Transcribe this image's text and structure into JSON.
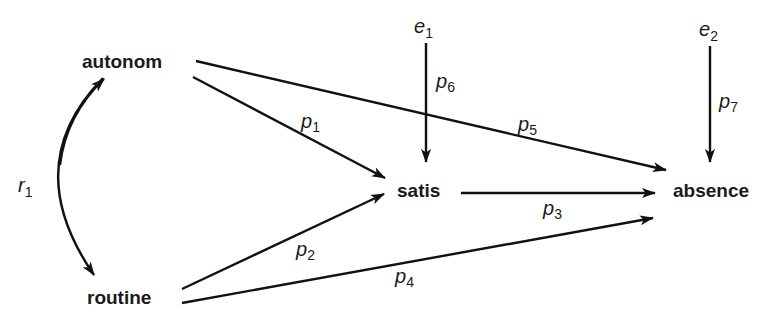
{
  "diagram": {
    "type": "path-diagram",
    "colors": {
      "ink": "#111111",
      "background": "#ffffff"
    },
    "nodes": {
      "autonom": {
        "label": "autonom"
      },
      "routine": {
        "label": "routine"
      },
      "satis": {
        "label": "satis"
      },
      "absence": {
        "label": "absence"
      },
      "e1": {
        "base": "e",
        "sub": "1"
      },
      "e2": {
        "base": "e",
        "sub": "2"
      }
    },
    "edges": [
      {
        "id": "p1",
        "from": "autonom",
        "to": "satis",
        "base": "p",
        "sub": "1"
      },
      {
        "id": "p2",
        "from": "routine",
        "to": "satis",
        "base": "p",
        "sub": "2"
      },
      {
        "id": "p3",
        "from": "satis",
        "to": "absence",
        "base": "p",
        "sub": "3"
      },
      {
        "id": "p4",
        "from": "routine",
        "to": "absence",
        "base": "p",
        "sub": "4"
      },
      {
        "id": "p5",
        "from": "autonom",
        "to": "absence",
        "base": "p",
        "sub": "5"
      },
      {
        "id": "p6",
        "from": "e1",
        "to": "satis",
        "base": "p",
        "sub": "6"
      },
      {
        "id": "p7",
        "from": "e2",
        "to": "absence",
        "base": "p",
        "sub": "7"
      }
    ],
    "correlation": {
      "id": "r1",
      "between": [
        "autonom",
        "routine"
      ],
      "base": "r",
      "sub": "1"
    }
  }
}
